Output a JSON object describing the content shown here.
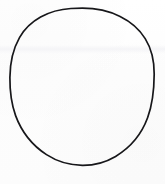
{
  "document": {
    "kind": "scanned-line-drawing",
    "title": "Circle",
    "canvas_width": 165,
    "canvas_height": 184,
    "background_color": "#fdfdfd",
    "caption": ""
  },
  "figure": {
    "shape_name": "circle",
    "stroke_color": "#17171a",
    "stroke_width": 1.7,
    "fill_color": "none",
    "center_x": 82,
    "center_y": 86,
    "radius_x": 72,
    "radius_y": 78.5,
    "bounds": {
      "left": 10,
      "top": 8,
      "right": 154,
      "bottom": 165
    }
  },
  "artifacts": {
    "scan_band_label": "faint horizontal scan band",
    "scan_band_top": 45,
    "scan_band_height": 9,
    "scan_band_color": "#f3f3f6"
  }
}
